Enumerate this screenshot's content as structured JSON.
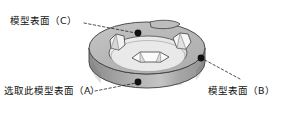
{
  "figure": {
    "type": "3d-technical-illustration",
    "background_color": "#ffffff",
    "outline_color": "#3a3a3a",
    "colors": {
      "top_ring_face": "#b9b9b9",
      "inner_recess_face": "#e8e8e8",
      "outer_wall_left": "#8f8f8f",
      "outer_wall_mid": "#b5b5b5",
      "outer_wall_right": "#9a9a9a",
      "patch_highlight": "#f7f7f7",
      "patch_shadow": "#a3a3a3",
      "marker_dot": "#111111",
      "leader_line": "#1a1a1a"
    }
  },
  "annotations": {
    "surface_c": {
      "label": "模型表面（C）",
      "marker_dot": {
        "x": 138,
        "y": 33
      },
      "leader_start": {
        "x": 84,
        "y": 23
      },
      "leader_end": {
        "x": 136,
        "y": 33
      }
    },
    "surface_a": {
      "label": "选取此模型表面（A）",
      "marker_dot": {
        "x": 138,
        "y": 82
      },
      "leader_start": {
        "x": 95,
        "y": 91
      },
      "leader_end": {
        "x": 136,
        "y": 83
      }
    },
    "surface_b": {
      "label": "模型表面（B）",
      "marker_dot": {
        "x": 201,
        "y": 58
      },
      "leader_start": {
        "x": 240,
        "y": 79
      },
      "leader_end": {
        "x": 203,
        "y": 59
      }
    }
  },
  "surface_patches": [
    {
      "id": "patch-top-far",
      "location": "top ring, far side",
      "style": "outlined lens shape"
    },
    {
      "id": "patch-top-right",
      "location": "top ring, right side",
      "style": "white faceted polygon"
    },
    {
      "id": "patch-top-left",
      "location": "top ring, left side",
      "style": "white faceted polygon"
    },
    {
      "id": "patch-recess",
      "location": "inner recess floor",
      "style": "white faceted polygon"
    }
  ]
}
